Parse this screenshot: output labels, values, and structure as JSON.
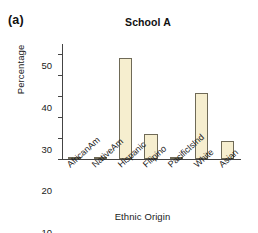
{
  "figure": {
    "panel_label": "(a)",
    "title": "School A"
  },
  "chart_data": {
    "type": "bar",
    "title": "School A",
    "xlabel": "Ethnic Origin",
    "ylabel": "Percentage",
    "categories": [
      "AfricanAm",
      "NativeAm",
      "Hispanic",
      "Filipino",
      "PacificIsInd",
      "White",
      "Asian"
    ],
    "values": [
      1.1,
      0.9,
      48.3,
      11.9,
      0.5,
      31.4,
      8.6
    ],
    "ylim": [
      0,
      55
    ],
    "yticks": [
      0,
      10,
      20,
      30,
      40,
      50
    ],
    "ytick_labels": [
      "0",
      "10",
      "20",
      "30",
      "40",
      "50"
    ],
    "grid": false,
    "legend": "none",
    "bar_fill_color": "#F6EECF",
    "bar_edge_color": "#6F6A57",
    "axis_color": "#444444",
    "xtick_label_rotation": -42
  }
}
